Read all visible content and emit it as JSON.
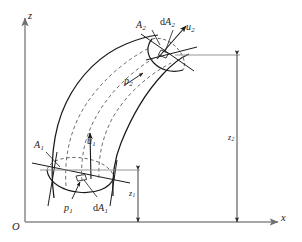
{
  "figure": {
    "kind": "stream-tube-diagram",
    "line_color": "#1a1a1a",
    "dashed_color": "#555555",
    "axis_color": "#8a8a8a",
    "background": "#ffffff"
  },
  "axes": {
    "origin_label": "O",
    "vertical_label": "z",
    "horizontal_label": "x"
  },
  "labels": {
    "area_lower": {
      "base": "A",
      "sub": "1"
    },
    "area_upper": {
      "base": "A",
      "sub": "2"
    },
    "elem_area_lower": {
      "rm": "d",
      "base": "A",
      "sub": "1"
    },
    "elem_area_upper": {
      "rm": "d",
      "base": "A",
      "sub": "2"
    },
    "pressure_lower": {
      "base": "p",
      "sub": "1"
    },
    "pressure_upper": {
      "base": "p",
      "sub": "2"
    },
    "velocity_lower": {
      "base": "u",
      "sub": "1"
    },
    "velocity_upper": {
      "base": "u",
      "sub": "2"
    },
    "elevation_lower": {
      "base": "z",
      "sub": "1"
    },
    "elevation_upper": {
      "base": "z",
      "sub": "2"
    }
  },
  "text": {
    "origin": "O",
    "z_axis": "z",
    "x_axis": "x",
    "A1": "A",
    "A1_sub": "1",
    "A2": "A",
    "A2_sub": "2",
    "dA1_rm": "d",
    "dA1": "A",
    "dA1_sub": "1",
    "dA2_rm": "d",
    "dA2": "A",
    "dA2_sub": "2",
    "p1": "p",
    "p1_sub": "1",
    "p2": "p",
    "p2_sub": "2",
    "u1": "u",
    "u1_sub": "1",
    "u2": "u",
    "u2_sub": "2",
    "z1": "z",
    "z1_sub": "1",
    "z2": "z",
    "z2_sub": "2"
  }
}
